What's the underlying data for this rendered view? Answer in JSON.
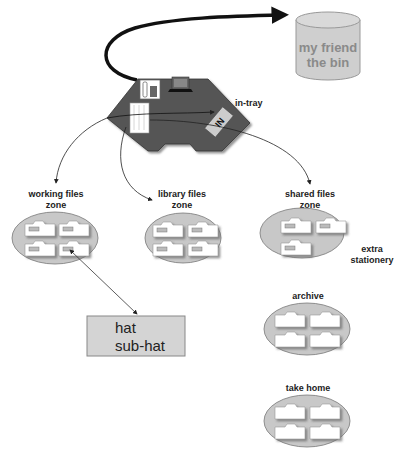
{
  "diagram": {
    "bin": {
      "line1": "my friend",
      "line2": "the bin"
    },
    "desk": {
      "in_tray_label": "in-tray",
      "in_tray_sign": "IN"
    },
    "zones": [
      {
        "id": "working",
        "line1": "working files",
        "line2": "zone",
        "folders": 4,
        "tabs": true
      },
      {
        "id": "library",
        "line1": "library files",
        "line2": "zone",
        "folders": 4,
        "tabs": true
      },
      {
        "id": "shared",
        "line1": "shared files",
        "line2": "zone",
        "folders": 3,
        "tabs": true,
        "side_label_1": "extra",
        "side_label_2": "stationery"
      },
      {
        "id": "archive",
        "line1": "archive",
        "folders": 4,
        "tabs": false
      },
      {
        "id": "take_home",
        "line1": "take home",
        "folders": 4,
        "tabs": false
      }
    ],
    "hat_box": {
      "line1": "hat",
      "line2": "sub-hat"
    },
    "colors": {
      "desk": "#555555",
      "ellipse": "#c8c8c8",
      "bin": "#cfcfcf",
      "hat_box": "#d4d4d4",
      "folder": "#ffffff",
      "arrow": "#222222"
    }
  }
}
